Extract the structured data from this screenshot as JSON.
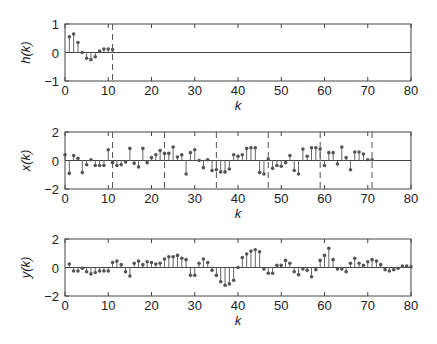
{
  "chart_data": [
    {
      "type": "stem",
      "ylabel": "h(k)",
      "xlabel": "k",
      "xlim": [
        0,
        80
      ],
      "ylim": [
        -1,
        1
      ],
      "xticks": [
        0,
        10,
        20,
        30,
        40,
        50,
        60,
        70,
        80
      ],
      "yticks": [
        -1,
        0,
        1
      ],
      "dashed_lines_k": [
        11
      ],
      "x": [
        1,
        2,
        3,
        4,
        5,
        6,
        7,
        8,
        9,
        10,
        11
      ],
      "values": [
        0.55,
        0.65,
        0.35,
        0.0,
        -0.2,
        -0.25,
        -0.15,
        0.05,
        0.12,
        0.12,
        0.1
      ]
    },
    {
      "type": "stem",
      "ylabel": "x(k)",
      "xlabel": "k",
      "xlim": [
        0,
        80
      ],
      "ylim": [
        -2,
        2
      ],
      "xticks": [
        0,
        10,
        20,
        30,
        40,
        50,
        60,
        70,
        80
      ],
      "yticks": [
        -2,
        0,
        2
      ],
      "dashed_lines_k": [
        11,
        23,
        35,
        47,
        59,
        71
      ],
      "x": [
        0,
        1,
        2,
        3,
        4,
        5,
        6,
        7,
        8,
        9,
        10,
        11,
        12,
        13,
        14,
        15,
        16,
        17,
        18,
        19,
        20,
        21,
        22,
        23,
        24,
        25,
        26,
        27,
        28,
        29,
        30,
        31,
        32,
        33,
        34,
        35,
        36,
        37,
        38,
        39,
        40,
        41,
        42,
        43,
        44,
        45,
        46,
        47,
        48,
        49,
        50,
        51,
        52,
        53,
        54,
        55,
        56,
        57,
        58,
        59,
        60,
        61,
        62,
        63,
        64,
        65,
        66,
        67,
        68,
        69,
        70,
        71
      ],
      "values": [
        0.4,
        -0.9,
        0.35,
        0.15,
        -0.85,
        -0.3,
        0.05,
        -0.35,
        -0.35,
        -0.35,
        0.75,
        -0.15,
        -0.35,
        -0.3,
        -0.1,
        0.85,
        -0.2,
        -0.45,
        0.85,
        -0.15,
        0.2,
        0.4,
        0.7,
        0.5,
        0.5,
        0.95,
        0.25,
        0.4,
        -0.95,
        0.55,
        0.75,
        0.0,
        -0.5,
        0.05,
        -0.7,
        -0.65,
        -0.8,
        -0.8,
        -0.6,
        0.4,
        0.3,
        0.4,
        0.85,
        0.9,
        0.9,
        -0.85,
        -0.95,
        0.1,
        -0.55,
        -0.35,
        -0.4,
        -0.15,
        0.35,
        -0.7,
        -0.95,
        0.8,
        0.3,
        0.9,
        0.9,
        0.8,
        -0.35,
        0.55,
        0.55,
        -0.25,
        0.95,
        0.2,
        -0.65,
        0.6,
        0.6,
        0.45,
        0.05,
        0.05
      ]
    },
    {
      "type": "stem",
      "ylabel": "y(k)",
      "xlabel": "k",
      "xlim": [
        0,
        80
      ],
      "ylim": [
        -2,
        2
      ],
      "xticks": [
        0,
        10,
        20,
        30,
        40,
        50,
        60,
        70,
        80
      ],
      "yticks": [
        -2,
        0,
        2
      ],
      "dashed_lines_k": [],
      "x": [
        1,
        2,
        3,
        4,
        5,
        6,
        7,
        8,
        9,
        10,
        11,
        12,
        13,
        14,
        15,
        16,
        17,
        18,
        19,
        20,
        21,
        22,
        23,
        24,
        25,
        26,
        27,
        28,
        29,
        30,
        31,
        32,
        33,
        34,
        35,
        36,
        37,
        38,
        39,
        40,
        41,
        42,
        43,
        44,
        45,
        46,
        47,
        48,
        49,
        50,
        51,
        52,
        53,
        54,
        55,
        56,
        57,
        58,
        59,
        60,
        61,
        62,
        63,
        64,
        65,
        66,
        67,
        68,
        69,
        70,
        71,
        72,
        73,
        74,
        75,
        76,
        77,
        78,
        79,
        80
      ],
      "values": [
        0.25,
        -0.25,
        -0.25,
        -0.05,
        -0.3,
        -0.45,
        -0.35,
        -0.25,
        -0.25,
        -0.25,
        0.35,
        0.45,
        0.2,
        -0.3,
        -0.6,
        0.3,
        0.45,
        0.2,
        0.4,
        0.35,
        0.25,
        0.3,
        0.6,
        0.75,
        0.75,
        0.85,
        0.65,
        0.55,
        -0.55,
        -0.55,
        0.3,
        0.6,
        0.35,
        -0.2,
        -0.55,
        -1.0,
        -1.25,
        -1.15,
        -0.9,
        0.0,
        0.7,
        0.95,
        1.15,
        1.25,
        1.1,
        -0.1,
        -0.4,
        -0.4,
        0.15,
        0.15,
        0.5,
        0.3,
        -0.3,
        -0.5,
        -0.1,
        -0.2,
        -0.65,
        -0.15,
        0.5,
        0.85,
        1.35,
        0.55,
        -0.1,
        -0.1,
        -0.3,
        0.3,
        0.65,
        0.3,
        0.15,
        0.4,
        0.55,
        0.45,
        0.2,
        -0.15,
        -0.25,
        -0.15,
        -0.05,
        0.1,
        0.1,
        0.05
      ]
    }
  ]
}
